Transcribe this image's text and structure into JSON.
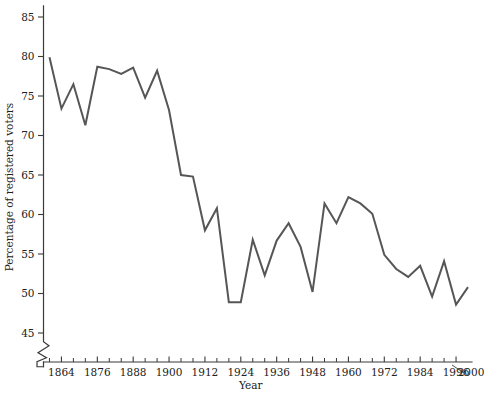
{
  "chart_data": {
    "type": "line",
    "title": "",
    "subtitle": "",
    "xlabel": "Year",
    "ylabel": "Percentage of registered voters",
    "xlim": [
      1858,
      2000
    ],
    "ylim": [
      43.5,
      86.5
    ],
    "grid": false,
    "legend": null,
    "axis_break": {
      "axis": "y",
      "below": 45,
      "symbol": "zigzag"
    },
    "x_tick_labels": [
      "1864",
      "1876",
      "1888",
      "1900",
      "1912",
      "1924",
      "1936",
      "1948",
      "1960",
      "1972",
      "1984",
      "1996",
      "2000"
    ],
    "x_tick_values": [
      1864,
      1876,
      1888,
      1900,
      1912,
      1924,
      1936,
      1948,
      1960,
      1972,
      1984,
      1996,
      2000
    ],
    "x_minor_tick_step": 4,
    "x_minor_tick_start": 1860,
    "x_minor_tick_end": 1996,
    "y_tick_labels": [
      "45",
      "50",
      "55",
      "60",
      "65",
      "70",
      "75",
      "80",
      "85"
    ],
    "y_tick_values": [
      45,
      50,
      55,
      60,
      65,
      70,
      75,
      80,
      85
    ],
    "series": [
      {
        "name": "Voter turnout",
        "color": "#565656",
        "x": [
          1860,
          1864,
          1868,
          1872,
          1876,
          1880,
          1884,
          1888,
          1892,
          1896,
          1900,
          1904,
          1908,
          1912,
          1916,
          1920,
          1924,
          1928,
          1932,
          1936,
          1940,
          1944,
          1948,
          1952,
          1956,
          1960,
          1964,
          1968,
          1972,
          1976,
          1980,
          1984,
          1988,
          1992,
          1996
        ],
        "values": [
          79.9,
          73.4,
          76.5,
          71.3,
          78.7,
          78.4,
          77.8,
          78.6,
          74.8,
          78.2,
          73.2,
          65.0,
          64.8,
          58.0,
          60.8,
          48.9,
          48.9,
          56.8,
          52.3,
          56.7,
          58.9,
          55.9,
          50.2,
          61.4,
          58.9,
          62.2,
          61.4,
          60.1,
          54.9,
          53.1,
          52.1,
          53.5,
          49.6,
          54.1,
          48.6
        ],
        "endpoint_x": 2000,
        "endpoint_value": 50.8
      }
    ]
  },
  "colors": {
    "line": "#565656",
    "axis": "#3a3a3a",
    "text": "#202020",
    "background": "#ffffff"
  }
}
